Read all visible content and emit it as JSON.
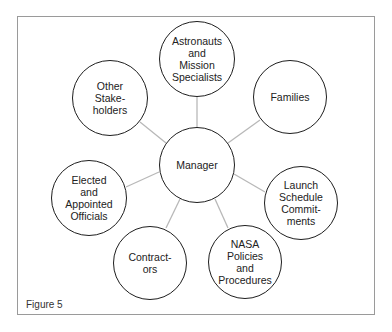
{
  "figure": {
    "caption": "Figure 5",
    "frame_border_color": "#9a9a9a",
    "connector_color": "#b8b8b8",
    "node_border_color": "#1e1e1e"
  },
  "diagram": {
    "type": "hub-and-spoke",
    "center": {
      "id": "manager",
      "label": "Manager"
    },
    "nodes": [
      {
        "id": "astronauts",
        "label": "Astronauts\nand\nMission\nSpecialists"
      },
      {
        "id": "families",
        "label": "Families"
      },
      {
        "id": "launch-schedule",
        "label": "Launch\nSchedule\nCommit-\nments"
      },
      {
        "id": "nasa-policies",
        "label": "NASA\nPolicies\nand\nProcedures"
      },
      {
        "id": "contractors",
        "label": "Contract-\nors"
      },
      {
        "id": "elected-officials",
        "label": "Elected\nand\nAppointed\nOfficials"
      },
      {
        "id": "other-stakeholders",
        "label": "Other\nStake-\nholders"
      }
    ],
    "edges": [
      {
        "from": "manager",
        "to": "astronauts"
      },
      {
        "from": "manager",
        "to": "families"
      },
      {
        "from": "manager",
        "to": "launch-schedule"
      },
      {
        "from": "manager",
        "to": "nasa-policies"
      },
      {
        "from": "manager",
        "to": "contractors"
      },
      {
        "from": "manager",
        "to": "elected-officials"
      },
      {
        "from": "manager",
        "to": "other-stakeholders"
      }
    ]
  }
}
